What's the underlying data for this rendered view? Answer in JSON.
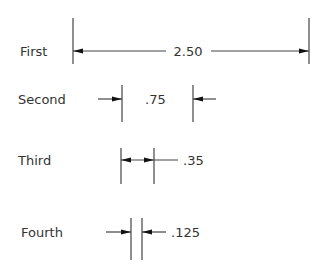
{
  "diagram": {
    "rows": [
      {
        "label": "First",
        "value": "2.50"
      },
      {
        "label": "Second",
        "value": ".75"
      },
      {
        "label": "Third",
        "value": ".35"
      },
      {
        "label": "Fourth",
        "value": ".125"
      }
    ]
  },
  "colors": {
    "line": "#444444",
    "arrow": "#111111",
    "text": "#333333",
    "background": "#ffffff"
  }
}
